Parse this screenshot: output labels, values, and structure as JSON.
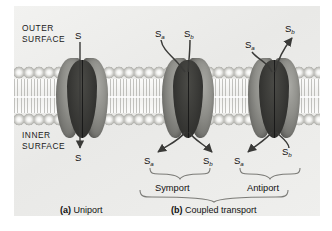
{
  "figure": {
    "type": "biology-diagram",
    "background_color": "#efefed",
    "membrane_label_outer": "OUTER\nSURFACE",
    "surfaces": {
      "outer_line1": "OUTER",
      "outer_line2": "SURFACE",
      "inner_line1": "INNER",
      "inner_line2": "SURFACE"
    }
  },
  "panels": [
    {
      "id": "uniport",
      "caption_marker": "(a)",
      "caption_text": "Uniport",
      "solutes_top": [
        {
          "base": "S",
          "sub": ""
        }
      ],
      "solutes_bottom": [
        {
          "base": "S",
          "sub": ""
        }
      ],
      "direction": "inward-single"
    },
    {
      "id": "symport",
      "mode_label": "Symport",
      "solutes_top": [
        {
          "base": "S",
          "sub": "a"
        },
        {
          "base": "S",
          "sub": "b"
        }
      ],
      "solutes_bottom": [
        {
          "base": "S",
          "sub": "a"
        },
        {
          "base": "S",
          "sub": "b"
        }
      ],
      "direction": "both-inward"
    },
    {
      "id": "antiport",
      "mode_label": "Antiport",
      "solutes_top": [
        {
          "base": "S",
          "sub": "a"
        },
        {
          "base": "S",
          "sub": "b"
        }
      ],
      "solutes_bottom": [
        {
          "base": "S",
          "sub": "a"
        },
        {
          "base": "S",
          "sub": "b"
        }
      ],
      "direction": "opposite"
    }
  ],
  "group_caption": {
    "marker": "(b)",
    "text": "Coupled transport"
  },
  "colors": {
    "protein_dark": "#2e2e2c",
    "protein_light": "#8e8e89",
    "arrow": "#3a3a38",
    "text": "#111111",
    "membrane_head": "#c9c9c5"
  }
}
